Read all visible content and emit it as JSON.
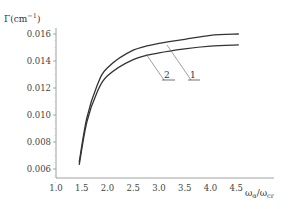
{
  "chart_data": {
    "type": "line",
    "title": "",
    "ylabel": "Γ(cm⁻¹)",
    "xlabel": "ωα/ωcr",
    "xlim": [
      1.0,
      4.6
    ],
    "ylim": [
      0.005,
      0.0165
    ],
    "x_ticks": [
      "1.0",
      "1.5",
      "2.0",
      "2.5",
      "3.0",
      "3.5",
      "4.0",
      "4.5"
    ],
    "y_ticks": [
      "0.006",
      "0.008",
      "0.010",
      "0.012",
      "0.014",
      "0.016"
    ],
    "grid": false,
    "legend": "inline labels with leader lines",
    "series": [
      {
        "name": "1",
        "x": [
          1.45,
          1.6,
          1.8,
          2.0,
          2.5,
          3.0,
          3.5,
          4.0,
          4.55
        ],
        "y": [
          0.0065,
          0.0098,
          0.0122,
          0.0135,
          0.0148,
          0.0153,
          0.0156,
          0.0159,
          0.016
        ]
      },
      {
        "name": "2",
        "x": [
          1.45,
          1.6,
          1.8,
          2.0,
          2.5,
          3.0,
          3.5,
          4.0,
          4.55
        ],
        "y": [
          0.0063,
          0.0095,
          0.0117,
          0.0129,
          0.0141,
          0.0146,
          0.0149,
          0.0151,
          0.0152
        ]
      }
    ]
  },
  "axis": {
    "y_label_main": "Γ(cm",
    "y_label_sup": "−1",
    "y_label_end": ")",
    "x_label_omega1": "ω",
    "x_label_sub1": "α",
    "x_label_slash": "/ω",
    "x_label_sub2": "cr"
  },
  "labels": {
    "curve1": "1",
    "curve2": "2"
  }
}
